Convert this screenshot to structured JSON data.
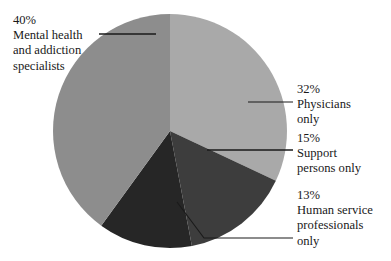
{
  "chart_data": {
    "type": "pie",
    "title": "",
    "subtitle": "",
    "xlabel": "",
    "ylabel": "",
    "grid": false,
    "legend_position": "none",
    "label_style": "external-with-leader-lines",
    "total_percent": 100,
    "slices": [
      {
        "name": "mental-health-and-addiction-specialists",
        "percent_label": "40%",
        "value": 40,
        "label_lines": [
          "Mental health",
          "and addiction",
          "specialists"
        ],
        "color": "#8d8d8d"
      },
      {
        "name": "physicians-only",
        "percent_label": "32%",
        "value": 32,
        "label_lines": [
          "Physicians",
          "only"
        ],
        "color": "#a9a9a9"
      },
      {
        "name": "support-persons-only",
        "percent_label": "15%",
        "value": 15,
        "label_lines": [
          "Support",
          "persons only"
        ],
        "color": "#3d3d3d"
      },
      {
        "name": "human-service-professionals-only",
        "percent_label": "13%",
        "value": 13,
        "label_lines": [
          "Human service",
          "professionals",
          "only"
        ],
        "color": "#262626"
      }
    ],
    "colors": {
      "slice_mental_health": "#8d8d8d",
      "slice_physicians": "#a9a9a9",
      "slice_support": "#3d3d3d",
      "slice_human_service": "#262626",
      "background": "#ffffff",
      "leader_line": "#1a1a1a",
      "text": "#191919"
    },
    "geometry": {
      "center_x": 170,
      "center_y": 131,
      "radius": 117
    }
  }
}
